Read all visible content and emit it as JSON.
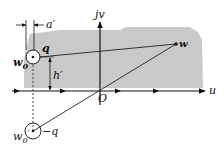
{
  "diagram": {
    "type": "complex-plane image charge diagram",
    "colors": {
      "region": "#c9c9c9",
      "line": "#222222",
      "background": "#ffffff"
    },
    "axes": {
      "horizontal_label": "u",
      "vertical_label": "jv",
      "origin_label": "O"
    },
    "points": {
      "source": {
        "label": "w0",
        "display": "w",
        "subscript": "0",
        "charge": "q"
      },
      "image": {
        "label": "w0'",
        "display": "w",
        "subscript": "0",
        "prime": "′",
        "charge": "−q"
      },
      "field": {
        "label": "w"
      }
    },
    "dimensions": {
      "horizontal": "a′",
      "vertical": "h′"
    }
  }
}
